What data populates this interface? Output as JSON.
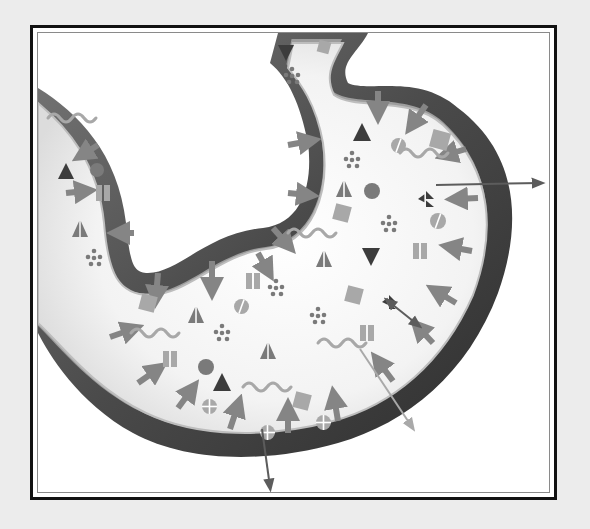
{
  "diagram": {
    "title": "",
    "type": "stomach-absorption-illustration",
    "style": "grayscale",
    "colors": {
      "page_background": "#ececec",
      "frame": "#111111",
      "inner_rule": "#8a8a8a",
      "canvas": "#ffffff",
      "outer_wall": "#5a5a5a",
      "outer_wall_dark": "#2e2e2e",
      "mucosa": "#9d9d9d",
      "lumen": "#f2f2f2",
      "shape_dark": "#3c3c3c",
      "shape_mid": "#7a7a7a",
      "shape_light": "#a8a8a8",
      "arrow": "#858585",
      "arrow_dark": "#5c5c5c",
      "arrow_light": "#a9a9a9"
    },
    "organ": {
      "wall_path": "M0,55 C40,80 80,120 88,190 C92,230 95,240 110,240 C140,240 170,200 225,195 C265,190 275,150 270,110 C262,70 250,45 232,30 L240,0 L330,0 C320,20 300,30 310,50 C330,60 380,40 420,75 C480,120 485,190 460,260 C430,340 370,390 300,410 C230,430 150,430 95,400 C40,370 10,320 0,300 Z",
      "lumen_path": "M0,70 C30,95 60,130 66,190 C70,240 80,262 112,262 C150,262 180,222 228,216 C275,210 292,160 285,110 C278,70 262,50 250,35 L255,10 L305,10 C298,25 285,40 296,62 C318,78 372,62 405,92 C455,138 458,200 435,262 C405,330 355,372 295,388 C232,405 160,405 108,380 C55,355 22,310 0,290 Z"
    },
    "molecules": [
      {
        "kind": "triangle-down",
        "x": 240,
        "y": 12,
        "size": 16,
        "tone": "dark"
      },
      {
        "kind": "dots",
        "x": 248,
        "y": 36,
        "tone": "mid"
      },
      {
        "kind": "square",
        "x": 280,
        "y": 8,
        "size": 12,
        "tone": "light"
      },
      {
        "kind": "triangle",
        "x": 20,
        "y": 130,
        "size": 16,
        "tone": "dark"
      },
      {
        "kind": "circle",
        "x": 52,
        "y": 130,
        "size": 14,
        "tone": "mid"
      },
      {
        "kind": "bars",
        "x": 58,
        "y": 152,
        "tone": "light"
      },
      {
        "kind": "split-triangle",
        "x": 34,
        "y": 188,
        "size": 16,
        "tone": "mid"
      },
      {
        "kind": "dots",
        "x": 50,
        "y": 218,
        "tone": "mid"
      },
      {
        "kind": "wave",
        "x": 10,
        "y": 85,
        "tone": "light"
      },
      {
        "kind": "triangle",
        "x": 315,
        "y": 90,
        "size": 18,
        "tone": "dark"
      },
      {
        "kind": "dots",
        "x": 308,
        "y": 120,
        "tone": "mid"
      },
      {
        "kind": "half-circle",
        "x": 353,
        "y": 105,
        "size": 15,
        "tone": "light"
      },
      {
        "kind": "square",
        "x": 393,
        "y": 98,
        "size": 18,
        "tone": "light"
      },
      {
        "kind": "split-triangle",
        "x": 298,
        "y": 148,
        "size": 16,
        "tone": "mid"
      },
      {
        "kind": "circle",
        "x": 326,
        "y": 150,
        "size": 16,
        "tone": "mid"
      },
      {
        "kind": "square",
        "x": 296,
        "y": 172,
        "size": 16,
        "tone": "light"
      },
      {
        "kind": "dots",
        "x": 345,
        "y": 184,
        "tone": "mid"
      },
      {
        "kind": "wave",
        "x": 362,
        "y": 120,
        "tone": "light"
      },
      {
        "kind": "burst-triangle",
        "x": 380,
        "y": 158,
        "size": 16,
        "tone": "dark"
      },
      {
        "kind": "half-circle",
        "x": 392,
        "y": 180,
        "size": 16,
        "tone": "light"
      },
      {
        "kind": "bars",
        "x": 375,
        "y": 210,
        "tone": "light"
      },
      {
        "kind": "triangle-down",
        "x": 324,
        "y": 215,
        "size": 18,
        "tone": "dark"
      },
      {
        "kind": "split-triangle",
        "x": 278,
        "y": 218,
        "size": 16,
        "tone": "mid"
      },
      {
        "kind": "wave",
        "x": 250,
        "y": 200,
        "tone": "light"
      },
      {
        "kind": "bars",
        "x": 208,
        "y": 240,
        "tone": "light"
      },
      {
        "kind": "dots",
        "x": 232,
        "y": 248,
        "tone": "mid"
      },
      {
        "kind": "dots",
        "x": 274,
        "y": 276,
        "tone": "mid"
      },
      {
        "kind": "square",
        "x": 308,
        "y": 254,
        "size": 16,
        "tone": "light"
      },
      {
        "kind": "burst-triangle",
        "x": 344,
        "y": 262,
        "size": 14,
        "tone": "dark"
      },
      {
        "kind": "bars",
        "x": 322,
        "y": 292,
        "tone": "light"
      },
      {
        "kind": "wave",
        "x": 280,
        "y": 310,
        "tone": "light"
      },
      {
        "kind": "half-circle",
        "x": 196,
        "y": 266,
        "size": 15,
        "tone": "light"
      },
      {
        "kind": "square",
        "x": 102,
        "y": 262,
        "size": 16,
        "tone": "light"
      },
      {
        "kind": "split-triangle",
        "x": 150,
        "y": 274,
        "size": 16,
        "tone": "mid"
      },
      {
        "kind": "wave",
        "x": 93,
        "y": 300,
        "tone": "light"
      },
      {
        "kind": "dots",
        "x": 178,
        "y": 293,
        "tone": "mid"
      },
      {
        "kind": "split-triangle",
        "x": 222,
        "y": 310,
        "size": 16,
        "tone": "mid"
      },
      {
        "kind": "bars",
        "x": 125,
        "y": 318,
        "tone": "light"
      },
      {
        "kind": "circle",
        "x": 160,
        "y": 326,
        "size": 16,
        "tone": "mid"
      },
      {
        "kind": "triangle",
        "x": 175,
        "y": 340,
        "size": 18,
        "tone": "dark"
      },
      {
        "kind": "cross-circle",
        "x": 164,
        "y": 366,
        "size": 15,
        "tone": "light"
      },
      {
        "kind": "wave",
        "x": 205,
        "y": 354,
        "tone": "light"
      },
      {
        "kind": "cross-circle",
        "x": 222,
        "y": 392,
        "size": 15,
        "tone": "light"
      },
      {
        "kind": "square",
        "x": 256,
        "y": 360,
        "size": 16,
        "tone": "light"
      },
      {
        "kind": "cross-circle",
        "x": 278,
        "y": 382,
        "size": 15,
        "tone": "light"
      }
    ],
    "inward_arrows": [
      {
        "x1": 340,
        "y1": 58,
        "x2": 340,
        "y2": 80
      },
      {
        "x1": 388,
        "y1": 72,
        "x2": 374,
        "y2": 92
      },
      {
        "x1": 428,
        "y1": 116,
        "x2": 408,
        "y2": 122
      },
      {
        "x1": 440,
        "y1": 165,
        "x2": 418,
        "y2": 166
      },
      {
        "x1": 434,
        "y1": 218,
        "x2": 412,
        "y2": 214
      },
      {
        "x1": 418,
        "y1": 270,
        "x2": 398,
        "y2": 258
      },
      {
        "x1": 395,
        "y1": 310,
        "x2": 380,
        "y2": 294
      },
      {
        "x1": 355,
        "y1": 348,
        "x2": 340,
        "y2": 328
      },
      {
        "x1": 300,
        "y1": 388,
        "x2": 296,
        "y2": 364
      },
      {
        "x1": 250,
        "y1": 400,
        "x2": 250,
        "y2": 376
      },
      {
        "x1": 192,
        "y1": 396,
        "x2": 200,
        "y2": 372
      },
      {
        "x1": 140,
        "y1": 375,
        "x2": 154,
        "y2": 356
      },
      {
        "x1": 100,
        "y1": 350,
        "x2": 120,
        "y2": 336
      },
      {
        "x1": 72,
        "y1": 304,
        "x2": 95,
        "y2": 296
      },
      {
        "x1": 250,
        "y1": 112,
        "x2": 272,
        "y2": 108
      },
      {
        "x1": 250,
        "y1": 160,
        "x2": 270,
        "y2": 162
      },
      {
        "x1": 235,
        "y1": 195,
        "x2": 250,
        "y2": 212
      },
      {
        "x1": 60,
        "y1": 112,
        "x2": 44,
        "y2": 122
      },
      {
        "x1": 28,
        "y1": 160,
        "x2": 48,
        "y2": 158
      },
      {
        "x1": 96,
        "y1": 200,
        "x2": 80,
        "y2": 200
      },
      {
        "x1": 174,
        "y1": 228,
        "x2": 174,
        "y2": 256
      },
      {
        "x1": 120,
        "y1": 240,
        "x2": 118,
        "y2": 264
      },
      {
        "x1": 220,
        "y1": 220,
        "x2": 230,
        "y2": 238
      }
    ],
    "outward_arrows": [
      {
        "x1": 398,
        "y1": 152,
        "x2": 502,
        "y2": 150,
        "tone": "dark"
      },
      {
        "x1": 350,
        "y1": 268,
        "x2": 380,
        "y2": 292,
        "tone": "dark",
        "double": true
      },
      {
        "x1": 322,
        "y1": 316,
        "x2": 374,
        "y2": 394,
        "tone": "light"
      },
      {
        "x1": 224,
        "y1": 396,
        "x2": 232,
        "y2": 454,
        "tone": "dark"
      }
    ]
  }
}
